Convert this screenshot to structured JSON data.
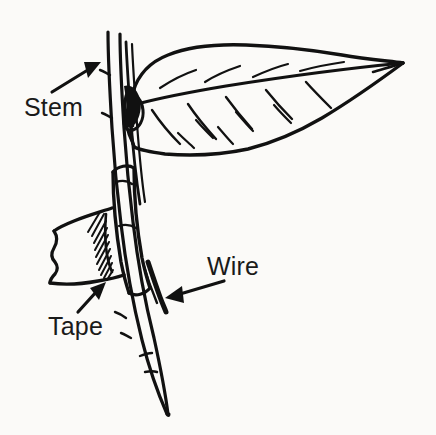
{
  "figure": {
    "kind": "line-drawing-diagram",
    "background_color": "#fbfaf8",
    "ink_color": "#111111",
    "width": 436,
    "height": 435
  },
  "labels": [
    {
      "id": "stem",
      "text": "Stem",
      "x": 24,
      "y": 95,
      "arrow": {
        "from_x": 52,
        "from_y": 92,
        "to_x": 101,
        "to_y": 62
      }
    },
    {
      "id": "tape",
      "text": "Tape",
      "x": 48,
      "y": 314,
      "arrow": {
        "from_x": 78,
        "from_y": 312,
        "to_x": 106,
        "to_y": 282
      }
    },
    {
      "id": "wire",
      "text": "Wire",
      "x": 207,
      "y": 254,
      "arrow": {
        "from_x": 222,
        "from_y": 281,
        "to_x": 165,
        "to_y": 298
      }
    }
  ],
  "parts": {
    "leaf": "leaf blade with midrib and lateral veins, tip at right",
    "stem": "vertical woody stem running top to bottom left of center",
    "wire": "thin wire running parallel alongside the stem",
    "tape": "tape strip wrapped around stem and wire, with hatched shading"
  }
}
